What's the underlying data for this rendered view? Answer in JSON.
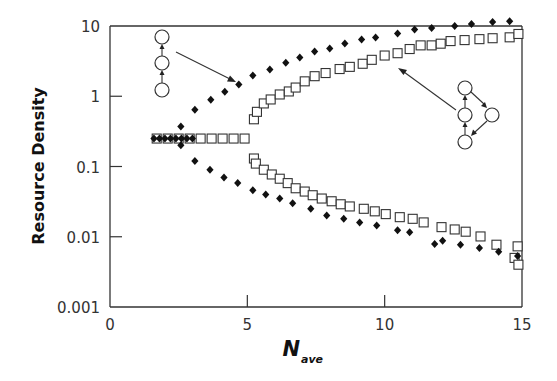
{
  "chart_data": {
    "type": "scatter",
    "title": "",
    "xlabel": "N",
    "xlabel_subscript": "ave",
    "ylabel": "Resource Density",
    "xlim": [
      0,
      15
    ],
    "ylim": [
      0.001,
      10
    ],
    "yscale": "log",
    "grid": false,
    "legend": "none",
    "x_ticks": [
      {
        "value": 0,
        "label": "0"
      },
      {
        "value": 5,
        "label": "5"
      },
      {
        "value": 10,
        "label": "10"
      },
      {
        "value": 15,
        "label": "15"
      }
    ],
    "y_ticks": [
      {
        "value": 10,
        "label": "10"
      },
      {
        "value": 1,
        "label": "1"
      },
      {
        "value": 0.1,
        "label": "0.1"
      },
      {
        "value": 0.01,
        "label": "0.01"
      },
      {
        "value": 0.001,
        "label": "0.001"
      }
    ],
    "series": [
      {
        "name": "chain network (filled diamonds)",
        "marker": "diamond-filled",
        "color": "#111111",
        "points": [
          [
            1.6,
            0.25
          ],
          [
            1.8,
            0.25
          ],
          [
            2.0,
            0.25
          ],
          [
            2.2,
            0.25
          ],
          [
            2.4,
            0.25
          ],
          [
            2.6,
            0.25
          ],
          [
            2.8,
            0.25
          ],
          [
            3.0,
            0.25
          ],
          [
            2.58,
            0.37
          ],
          [
            3.09,
            0.64
          ],
          [
            3.67,
            0.89
          ],
          [
            4.18,
            1.16
          ],
          [
            4.69,
            1.47
          ],
          [
            5.2,
            1.98
          ],
          [
            5.82,
            2.4
          ],
          [
            6.4,
            3.0
          ],
          [
            6.91,
            3.56
          ],
          [
            7.45,
            4.33
          ],
          [
            8.0,
            4.8
          ],
          [
            8.55,
            5.62
          ],
          [
            9.16,
            6.4
          ],
          [
            9.67,
            6.85
          ],
          [
            10.47,
            7.8
          ],
          [
            11.09,
            8.9
          ],
          [
            11.71,
            9.4
          ],
          [
            12.55,
            10.0
          ],
          [
            13.16,
            10.7
          ],
          [
            13.93,
            11.4
          ],
          [
            14.55,
            11.7
          ],
          [
            2.58,
            0.2
          ],
          [
            3.09,
            0.12
          ],
          [
            3.64,
            0.09
          ],
          [
            4.15,
            0.07
          ],
          [
            4.65,
            0.058
          ],
          [
            5.2,
            0.046
          ],
          [
            5.67,
            0.04
          ],
          [
            6.18,
            0.035
          ],
          [
            6.65,
            0.03
          ],
          [
            7.31,
            0.025
          ],
          [
            7.89,
            0.02
          ],
          [
            8.51,
            0.018
          ],
          [
            9.09,
            0.016
          ],
          [
            9.71,
            0.0145
          ],
          [
            10.47,
            0.0124
          ],
          [
            10.91,
            0.0116
          ],
          [
            11.82,
            0.0079
          ],
          [
            12.11,
            0.0088
          ],
          [
            12.76,
            0.0077
          ],
          [
            13.45,
            0.0069
          ],
          [
            14.15,
            0.0061
          ],
          [
            14.84,
            0.0053
          ]
        ]
      },
      {
        "name": "autocatalytic loop network (open squares)",
        "marker": "square-open",
        "color": "#333333",
        "points": [
          [
            1.7,
            0.25
          ],
          [
            2.1,
            0.25
          ],
          [
            2.5,
            0.25
          ],
          [
            2.9,
            0.25
          ],
          [
            3.3,
            0.25
          ],
          [
            3.7,
            0.25
          ],
          [
            4.1,
            0.25
          ],
          [
            4.5,
            0.25
          ],
          [
            4.9,
            0.25
          ],
          [
            5.24,
            0.47
          ],
          [
            5.35,
            0.6
          ],
          [
            5.6,
            0.79
          ],
          [
            5.85,
            0.9
          ],
          [
            6.18,
            1.06
          ],
          [
            6.51,
            1.17
          ],
          [
            6.76,
            1.33
          ],
          [
            7.09,
            1.63
          ],
          [
            7.45,
            1.93
          ],
          [
            7.85,
            2.14
          ],
          [
            8.36,
            2.44
          ],
          [
            8.73,
            2.62
          ],
          [
            9.2,
            2.9
          ],
          [
            9.53,
            3.3
          ],
          [
            10.0,
            3.8
          ],
          [
            10.47,
            4.1
          ],
          [
            10.91,
            4.7
          ],
          [
            11.31,
            5.3
          ],
          [
            11.71,
            5.3
          ],
          [
            12.04,
            5.6
          ],
          [
            12.4,
            6.1
          ],
          [
            12.91,
            6.3
          ],
          [
            13.45,
            6.5
          ],
          [
            13.93,
            6.7
          ],
          [
            14.55,
            6.9
          ],
          [
            14.87,
            7.7
          ],
          [
            5.24,
            0.13
          ],
          [
            5.31,
            0.11
          ],
          [
            5.6,
            0.09
          ],
          [
            5.89,
            0.077
          ],
          [
            6.18,
            0.067
          ],
          [
            6.47,
            0.058
          ],
          [
            6.76,
            0.049
          ],
          [
            7.09,
            0.044
          ],
          [
            7.38,
            0.039
          ],
          [
            7.71,
            0.035
          ],
          [
            8.07,
            0.032
          ],
          [
            8.4,
            0.029
          ],
          [
            8.73,
            0.027
          ],
          [
            9.24,
            0.025
          ],
          [
            9.64,
            0.023
          ],
          [
            10.04,
            0.021
          ],
          [
            10.55,
            0.019
          ],
          [
            11.02,
            0.018
          ],
          [
            11.42,
            0.016
          ],
          [
            12.07,
            0.0137
          ],
          [
            12.55,
            0.0127
          ],
          [
            12.95,
            0.0118
          ],
          [
            13.49,
            0.0101
          ],
          [
            14.07,
            0.0077
          ],
          [
            14.73,
            0.005
          ],
          [
            14.84,
            0.0073
          ],
          [
            14.87,
            0.004
          ]
        ]
      }
    ],
    "annotations": [
      {
        "type": "network-diagram",
        "description": "linear chain of three nodes with upward arrows",
        "arrow_to": "filled diamonds upper branch",
        "position": "upper-left"
      },
      {
        "type": "network-diagram",
        "description": "four-node loop: vertical chain of three nodes plus side node forming a cycle",
        "arrow_to": "open squares upper branch",
        "position": "right"
      }
    ]
  },
  "axes": {
    "y_title": "Resource Density",
    "x_title_main": "N",
    "x_title_sub": "ave",
    "x_tick_labels": [
      "0",
      "5",
      "10",
      "15"
    ],
    "y_tick_labels": [
      "10",
      "1",
      "0.1",
      "0.01",
      "0.001"
    ]
  },
  "colors": {
    "axis": "#333333",
    "diamond": "#111111",
    "square_stroke": "#333333",
    "background": "#ffffff"
  }
}
